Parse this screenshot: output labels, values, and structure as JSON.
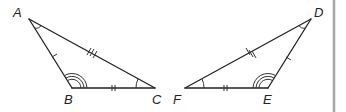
{
  "diagram": {
    "type": "congruent-triangles",
    "triangles": [
      {
        "name": "triangle-ABC",
        "vertices": [
          {
            "label": "A",
            "x": 29,
            "y": 19,
            "lx": 13,
            "ly": 17
          },
          {
            "label": "B",
            "x": 72,
            "y": 88,
            "lx": 64,
            "ly": 104
          },
          {
            "label": "C",
            "x": 155,
            "y": 88,
            "lx": 152,
            "ly": 104
          }
        ],
        "tick_marks": {
          "AB": 1,
          "BC": 2,
          "AC": 3
        },
        "angle_arcs": {
          "A": 1,
          "B": 3,
          "C": 1
        }
      },
      {
        "name": "triangle-DEF",
        "vertices": [
          {
            "label": "D",
            "x": 311,
            "y": 19,
            "lx": 314,
            "ly": 17
          },
          {
            "label": "E",
            "x": 268,
            "y": 88,
            "lx": 263,
            "ly": 104
          },
          {
            "label": "F",
            "x": 185,
            "y": 88,
            "lx": 173,
            "ly": 104
          }
        ],
        "tick_marks": {
          "DE": 1,
          "EF": 2,
          "DF": 3
        },
        "angle_arcs": {
          "D": 1,
          "E": 3,
          "F": 1
        }
      }
    ],
    "colors": {
      "stroke": "#222222",
      "divider": "#a6a6a6",
      "background": "#ffffff"
    }
  },
  "labels": {
    "A": "A",
    "B": "B",
    "C": "C",
    "D": "D",
    "E": "E",
    "F": "F"
  }
}
